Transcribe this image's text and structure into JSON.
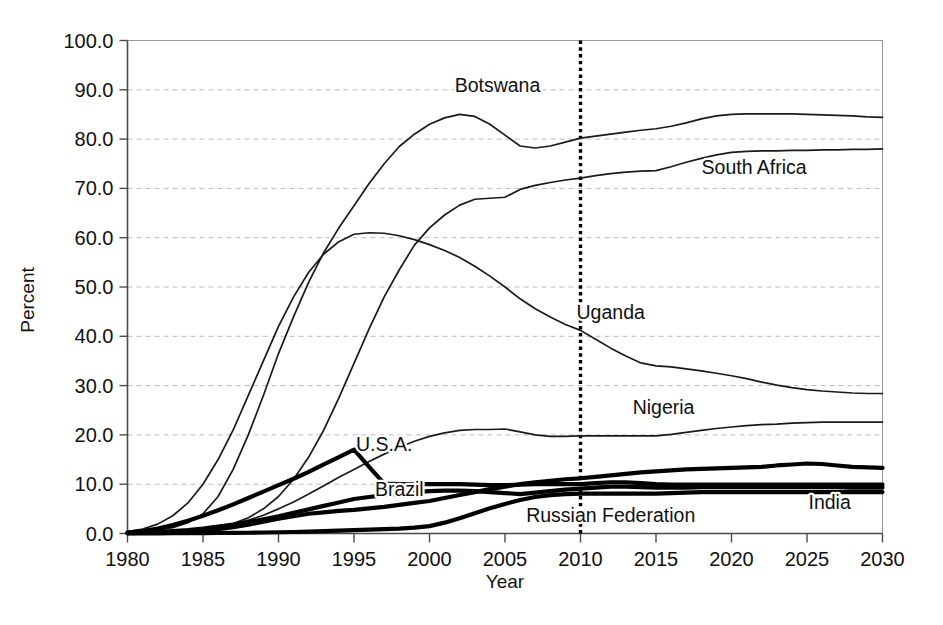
{
  "chart_data": {
    "type": "line",
    "title": "",
    "xlabel": "Year",
    "ylabel": "Percent",
    "xlim": [
      1980,
      2030
    ],
    "ylim": [
      0,
      100
    ],
    "grid": true,
    "legend_position": "inline-labels",
    "x_ticks": [
      "1980",
      "1985",
      "1990",
      "1995",
      "2000",
      "2005",
      "2010",
      "2015",
      "2020",
      "2025",
      "2030"
    ],
    "y_ticks": [
      "0.0",
      "10.0",
      "20.0",
      "30.0",
      "40.0",
      "50.0",
      "60.0",
      "70.0",
      "80.0",
      "90.0",
      "100.0"
    ],
    "annotations": [
      {
        "text": "2010 marker",
        "type": "vertical-dotted-line",
        "x": 2010
      }
    ],
    "x": [
      1980,
      1981,
      1982,
      1983,
      1984,
      1985,
      1986,
      1987,
      1988,
      1989,
      1990,
      1991,
      1992,
      1993,
      1994,
      1995,
      1996,
      1997,
      1998,
      1999,
      2000,
      2001,
      2002,
      2003,
      2004,
      2005,
      2006,
      2007,
      2008,
      2009,
      2010,
      2011,
      2012,
      2013,
      2014,
      2015,
      2016,
      2017,
      2018,
      2019,
      2020,
      2021,
      2022,
      2023,
      2024,
      2025,
      2026,
      2027,
      2028,
      2029,
      2030
    ],
    "series": [
      {
        "name": "Botswana",
        "weight": "thin",
        "label_x": 2004.5,
        "label_y": 89.5,
        "values": [
          0.2,
          0.4,
          0.7,
          1.2,
          2.2,
          4.0,
          7.5,
          13.0,
          20.0,
          28.0,
          36.5,
          44.0,
          51.0,
          57.0,
          62.0,
          66.5,
          71.0,
          75.0,
          78.5,
          81.0,
          83.0,
          84.3,
          85.0,
          84.6,
          83.0,
          80.8,
          78.6,
          78.2,
          78.6,
          79.4,
          80.2,
          80.6,
          81.0,
          81.4,
          81.8,
          82.1,
          82.6,
          83.3,
          84.1,
          84.7,
          85.0,
          85.1,
          85.1,
          85.1,
          85.1,
          85.0,
          84.9,
          84.8,
          84.7,
          84.5,
          84.4
        ]
      },
      {
        "name": "South Africa",
        "weight": "thin",
        "label_x": 2021.5,
        "label_y": 73.0,
        "values": [
          0.1,
          0.15,
          0.2,
          0.3,
          0.5,
          0.8,
          1.3,
          2.0,
          3.2,
          5.0,
          7.5,
          11.0,
          15.5,
          21.0,
          27.5,
          34.5,
          41.5,
          48.0,
          53.5,
          58.5,
          62.0,
          64.6,
          66.6,
          67.8,
          68.0,
          68.2,
          69.8,
          70.6,
          71.2,
          71.7,
          72.1,
          72.6,
          73.0,
          73.3,
          73.5,
          73.6,
          74.4,
          75.3,
          76.1,
          76.8,
          77.3,
          77.5,
          77.6,
          77.6,
          77.7,
          77.7,
          77.8,
          77.8,
          77.9,
          77.9,
          78.0
        ]
      },
      {
        "name": "Uganda",
        "weight": "thin",
        "label_x": 2012.0,
        "label_y": 43.5,
        "values": [
          0.4,
          0.9,
          1.9,
          3.6,
          6.2,
          10.0,
          15.0,
          21.0,
          28.0,
          35.0,
          42.0,
          48.0,
          53.0,
          56.7,
          59.2,
          60.7,
          61.0,
          60.9,
          60.4,
          59.6,
          58.6,
          57.4,
          56.0,
          54.2,
          52.2,
          50.0,
          47.6,
          45.6,
          43.9,
          42.4,
          41.2,
          39.4,
          37.6,
          36.0,
          34.6,
          34.0,
          33.8,
          33.4,
          33.0,
          32.5,
          32.0,
          31.4,
          30.7,
          30.1,
          29.6,
          29.2,
          28.9,
          28.7,
          28.5,
          28.4,
          28.4
        ]
      },
      {
        "name": "Nigeria",
        "weight": "thin",
        "label_x": 2015.5,
        "label_y": 24.2,
        "values": [
          0.1,
          0.2,
          0.3,
          0.4,
          0.6,
          0.9,
          1.3,
          1.9,
          2.7,
          3.7,
          5.0,
          6.4,
          8.0,
          9.7,
          11.4,
          13.0,
          14.6,
          16.1,
          17.5,
          18.7,
          19.7,
          20.4,
          20.9,
          21.1,
          21.1,
          21.2,
          20.6,
          20.0,
          19.7,
          19.7,
          19.8,
          19.8,
          19.8,
          19.8,
          19.8,
          19.8,
          20.1,
          20.5,
          20.9,
          21.3,
          21.6,
          21.9,
          22.1,
          22.2,
          22.4,
          22.5,
          22.6,
          22.6,
          22.6,
          22.6,
          22.6
        ]
      },
      {
        "name": "U.S.A.",
        "weight": "thick",
        "label_x": 1997.0,
        "label_y": 16.8,
        "values": [
          0.2,
          0.5,
          1.0,
          1.7,
          2.6,
          3.6,
          4.7,
          5.9,
          7.2,
          8.5,
          9.8,
          11.1,
          12.5,
          14.0,
          15.5,
          17.0,
          13.5,
          10.1,
          10.0,
          10.0,
          10.0,
          10.0,
          10.0,
          9.9,
          9.8,
          9.8,
          9.9,
          10.0,
          10.0,
          10.0,
          10.0,
          10.2,
          10.4,
          10.4,
          10.2,
          10.0,
          9.9,
          9.9,
          9.9,
          9.9,
          9.9,
          9.9,
          9.9,
          9.9,
          9.9,
          9.9,
          9.9,
          9.9,
          9.9,
          9.9,
          9.9
        ]
      },
      {
        "name": "Brazil",
        "weight": "thick",
        "label_x": 1998.0,
        "label_y": 7.6,
        "values": [
          0.1,
          0.2,
          0.3,
          0.5,
          0.7,
          1.0,
          1.4,
          1.8,
          2.3,
          2.9,
          3.5,
          4.2,
          4.9,
          5.6,
          6.3,
          7.0,
          7.4,
          7.8,
          8.1,
          8.4,
          8.6,
          8.7,
          8.7,
          8.6,
          8.4,
          8.2,
          8.0,
          8.3,
          8.6,
          8.9,
          9.1,
          9.3,
          9.5,
          9.5,
          9.4,
          9.3,
          9.3,
          9.3,
          9.4,
          9.4,
          9.4,
          9.4,
          9.4,
          9.4,
          9.4,
          9.4,
          9.4,
          9.4,
          9.3,
          9.3,
          9.3
        ]
      },
      {
        "name": "India",
        "weight": "thick",
        "label_x": 2026.5,
        "label_y": 5.0,
        "values": [
          0.05,
          0.1,
          0.15,
          0.25,
          0.4,
          0.6,
          0.9,
          1.3,
          1.8,
          2.4,
          3.0,
          3.5,
          4.0,
          4.3,
          4.6,
          4.8,
          5.1,
          5.4,
          5.8,
          6.2,
          6.6,
          7.2,
          7.8,
          8.4,
          9.0,
          9.5,
          10.0,
          10.4,
          10.7,
          11.0,
          11.2,
          11.5,
          11.8,
          12.1,
          12.4,
          12.6,
          12.8,
          13.0,
          13.1,
          13.2,
          13.3,
          13.4,
          13.5,
          13.8,
          14.0,
          14.2,
          14.1,
          13.8,
          13.5,
          13.4,
          13.3
        ]
      },
      {
        "name": "Russian Federation",
        "weight": "thick",
        "label_x": 2012.0,
        "label_y": 2.3,
        "values": [
          0.02,
          0.03,
          0.04,
          0.05,
          0.06,
          0.08,
          0.1,
          0.12,
          0.15,
          0.2,
          0.25,
          0.3,
          0.4,
          0.5,
          0.6,
          0.7,
          0.8,
          0.9,
          1.0,
          1.2,
          1.5,
          2.2,
          3.1,
          4.1,
          5.1,
          6.0,
          6.8,
          7.4,
          7.8,
          8.0,
          8.1,
          8.1,
          8.1,
          8.1,
          8.1,
          8.1,
          8.2,
          8.3,
          8.4,
          8.4,
          8.4,
          8.4,
          8.4,
          8.4,
          8.4,
          8.4,
          8.4,
          8.4,
          8.4,
          8.4,
          8.4
        ]
      }
    ]
  },
  "axes": {
    "y_title": "Percent",
    "x_title": "Year"
  },
  "colors": {
    "series": "#000000",
    "grid": "#b9b9c4",
    "axis": "#4a4a4a",
    "background": "#ffffff"
  }
}
